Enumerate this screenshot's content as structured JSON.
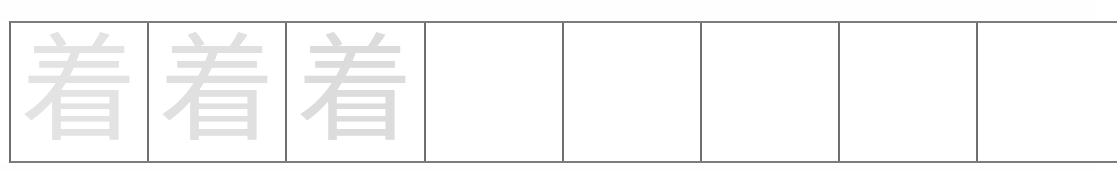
{
  "sheet": {
    "title": "Chinese character handwriting practice grid",
    "character": "着",
    "grid": {
      "columns": 8,
      "rows": 1,
      "cell_count": 8,
      "filled_count": 3,
      "empty_count": 5,
      "border_color": "#6f6f6f",
      "guide_stroke_color": "#dfdfdf",
      "background_color": "#ffffff"
    },
    "cells": [
      {
        "index": 1,
        "character": "着",
        "state": "guide",
        "shade": "#e3e3e3"
      },
      {
        "index": 2,
        "character": "着",
        "state": "guide",
        "shade": "#e0e0e0"
      },
      {
        "index": 3,
        "character": "着",
        "state": "guide",
        "shade": "#dcdcdc"
      },
      {
        "index": 4,
        "character": "",
        "state": "blank",
        "shade": "#ffffff"
      },
      {
        "index": 5,
        "character": "",
        "state": "blank",
        "shade": "#ffffff"
      },
      {
        "index": 6,
        "character": "",
        "state": "blank",
        "shade": "#ffffff"
      },
      {
        "index": 7,
        "character": "",
        "state": "blank",
        "shade": "#ffffff"
      },
      {
        "index": 8,
        "character": "",
        "state": "blank",
        "shade": "#ffffff"
      }
    ]
  }
}
